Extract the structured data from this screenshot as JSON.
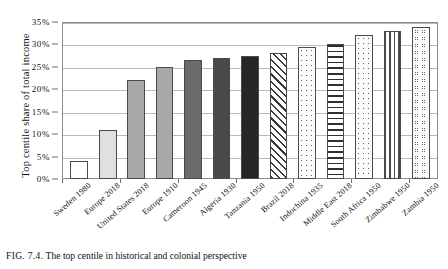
{
  "chart_data": {
    "type": "bar",
    "title": "",
    "xlabel": "",
    "ylabel": "Top centile share of total income",
    "ylim": [
      0,
      35
    ],
    "ytick_labels": [
      "0%",
      "5%",
      "10%",
      "15%",
      "20%",
      "25%",
      "30%",
      "35%"
    ],
    "ytick_values": [
      0,
      5,
      10,
      15,
      20,
      25,
      30,
      35
    ],
    "grid": true,
    "legend": "none",
    "categories": [
      "Sweden 1980",
      "Europe 2018",
      "United States 2018",
      "Europe 1910",
      "Cameroon 1945",
      "Algeria 1930",
      "Tanzania 1950",
      "Brazil 2018",
      "Indochina 1935",
      "Middle East 2018",
      "South Africa 1950",
      "Zimbabwe 1950",
      "Zambia 1950"
    ],
    "values": [
      4,
      11,
      22,
      25,
      26.5,
      27,
      27.5,
      28,
      29.5,
      30,
      32,
      33,
      34
    ],
    "bar_styles": [
      "f-white",
      "f-lightgray",
      "f-gray",
      "f-gray",
      "f-midgray",
      "f-darkgray",
      "f-black",
      "p-diagonal",
      "p-dots",
      "p-hlines",
      "p-dots",
      "p-vlines",
      "p-circles"
    ]
  },
  "caption": {
    "figure_number": "FIG. 7.4.",
    "text": "The top centile in historical and colonial perspective"
  }
}
